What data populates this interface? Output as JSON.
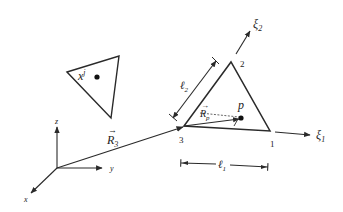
{
  "diagram": {
    "type": "geometry-schematic",
    "global_frame": {
      "axes": [
        {
          "name": "x",
          "label": "x"
        },
        {
          "name": "y",
          "label": "y"
        },
        {
          "name": "z",
          "label": "z"
        }
      ],
      "position_vector": {
        "symbol": "R",
        "subscript": "3",
        "label": "R⃗3"
      }
    },
    "source_element": {
      "label_base": "x",
      "label_sup": "j"
    },
    "target_element": {
      "vertices": [
        {
          "id": "1",
          "label": "1"
        },
        {
          "id": "2",
          "label": "2"
        },
        {
          "id": "3",
          "label": "3"
        }
      ],
      "point": {
        "label": "p"
      },
      "local_vector": {
        "symbol": "R",
        "subscript": "p"
      },
      "local_axes": [
        {
          "symbol": "ξ",
          "subscript": "1"
        },
        {
          "symbol": "ξ",
          "subscript": "2"
        }
      ],
      "dimensions": [
        {
          "symbol": "ℓ",
          "subscript": "1"
        },
        {
          "symbol": "ℓ",
          "subscript": "2"
        }
      ]
    },
    "colors": {
      "line": "#2a2a2a",
      "background": "#ffffff",
      "dash": "#555555"
    }
  }
}
